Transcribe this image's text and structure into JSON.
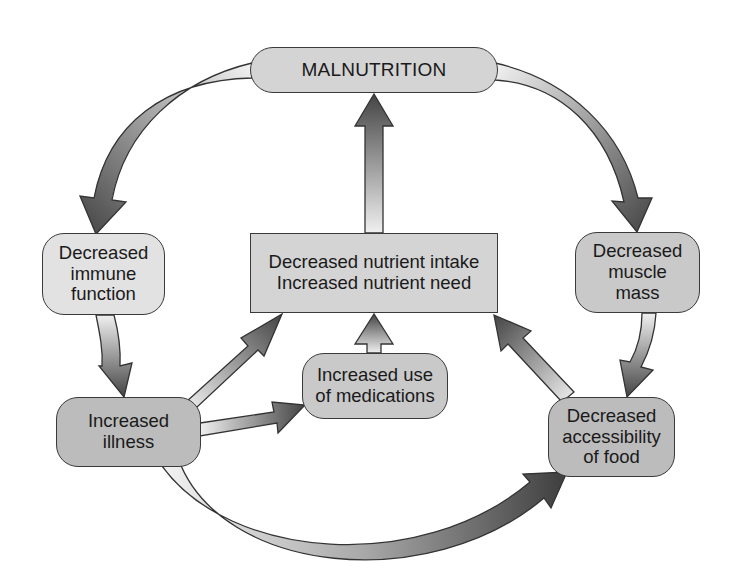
{
  "diagram": {
    "type": "cycle-flow",
    "nodes": {
      "malnutrition": {
        "label": "MALNUTRITION"
      },
      "central": {
        "lines": [
          "Decreased nutrient intake",
          "Increased nutrient need"
        ]
      },
      "immune": {
        "lines": [
          "Decreased",
          "immune",
          "function"
        ]
      },
      "muscle": {
        "lines": [
          "Decreased",
          "muscle",
          "mass"
        ]
      },
      "illness": {
        "lines": [
          "Increased",
          "illness"
        ]
      },
      "medications": {
        "lines": [
          "Increased use",
          "of medications"
        ]
      },
      "accessibility": {
        "lines": [
          "Decreased",
          "accessibility",
          "of food"
        ]
      }
    },
    "edges": [
      {
        "from": "malnutrition",
        "to": "immune"
      },
      {
        "from": "malnutrition",
        "to": "muscle"
      },
      {
        "from": "central",
        "to": "malnutrition"
      },
      {
        "from": "immune",
        "to": "illness"
      },
      {
        "from": "muscle",
        "to": "accessibility"
      },
      {
        "from": "illness",
        "to": "central"
      },
      {
        "from": "illness",
        "to": "medications"
      },
      {
        "from": "illness",
        "to": "accessibility"
      },
      {
        "from": "medications",
        "to": "central"
      },
      {
        "from": "accessibility",
        "to": "central"
      }
    ],
    "colors": {
      "arrow_light": "#f2f2f2",
      "arrow_dark": "#4a4a4a",
      "box_fill": "#d4d4d4",
      "outline": "#3a3a3a"
    }
  }
}
